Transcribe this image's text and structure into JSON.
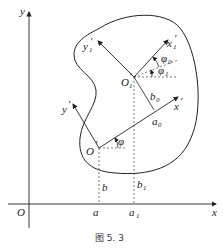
{
  "labels": {
    "y_axis": "y",
    "x_axis": "x",
    "origin": "O",
    "o_prime": "O",
    "o1_prime": "O",
    "y_prime": "y",
    "x_prime": "x",
    "x1_prime": "x",
    "y1_prime": "y",
    "phi": "φ",
    "phi0": "φ",
    "phi1": "φ",
    "a": "a",
    "a1": "a",
    "b": "b",
    "b1": "b",
    "a0": "a",
    "b0": "b",
    "sub0": "0",
    "sub1": "1",
    "prime": "′"
  },
  "caption": "图 5. 3"
}
